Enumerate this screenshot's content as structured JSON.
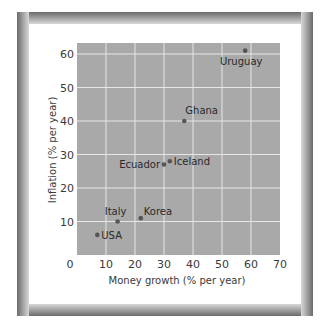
{
  "colors": {
    "plot_bg": "#a9a9a9",
    "grid": "#e6e6e6",
    "point": "#555555",
    "text": "#333333",
    "frame_dark": "#6a6a6a",
    "frame_light": "#d8d8d8"
  },
  "chart_data": {
    "type": "scatter",
    "title": "",
    "xlabel": "Money growth (% per year)",
    "ylabel": "Inflation (% per year)",
    "xlim": [
      0,
      70
    ],
    "ylim": [
      0,
      63
    ],
    "xticks": [
      0,
      10,
      20,
      30,
      40,
      50,
      60,
      70
    ],
    "yticks": [
      10,
      20,
      30,
      40,
      50,
      60
    ],
    "grid": true,
    "legend": null,
    "points": [
      {
        "label": "USA",
        "x": 7,
        "y": 6,
        "label_pos": "right"
      },
      {
        "label": "Italy",
        "x": 14,
        "y": 10,
        "label_pos": "above-left"
      },
      {
        "label": "Korea",
        "x": 22,
        "y": 11,
        "label_pos": "above-right"
      },
      {
        "label": "Ecuador",
        "x": 30,
        "y": 27,
        "label_pos": "left"
      },
      {
        "label": "Iceland",
        "x": 32,
        "y": 28,
        "label_pos": "right"
      },
      {
        "label": "Ghana",
        "x": 37,
        "y": 40,
        "label_pos": "above-right"
      },
      {
        "label": "Uruguay",
        "x": 58,
        "y": 61,
        "label_pos": "below"
      }
    ]
  }
}
